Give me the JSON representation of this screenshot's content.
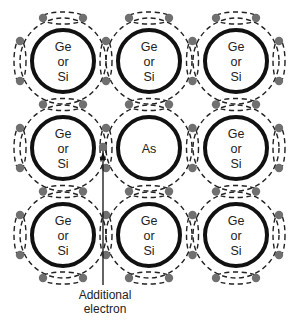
{
  "diagram": {
    "grid": {
      "rows": 3,
      "cols": 3,
      "centers_x": [
        63,
        149,
        236
      ],
      "centers_y": [
        61,
        148,
        235
      ],
      "atom_radius": 31,
      "bond_radius": 43
    },
    "atoms": [
      {
        "row": 0,
        "col": 0,
        "lines": [
          "Ge",
          "or",
          "Si"
        ]
      },
      {
        "row": 0,
        "col": 1,
        "lines": [
          "Ge",
          "or",
          "Si"
        ]
      },
      {
        "row": 0,
        "col": 2,
        "lines": [
          "Ge",
          "or",
          "Si"
        ]
      },
      {
        "row": 1,
        "col": 0,
        "lines": [
          "Ge",
          "or",
          "Si"
        ]
      },
      {
        "row": 1,
        "col": 1,
        "lines": [
          "As"
        ]
      },
      {
        "row": 1,
        "col": 2,
        "lines": [
          "Ge",
          "or",
          "Si"
        ]
      },
      {
        "row": 2,
        "col": 0,
        "lines": [
          "Ge",
          "or",
          "Si"
        ]
      },
      {
        "row": 2,
        "col": 1,
        "lines": [
          "Ge",
          "or",
          "Si"
        ]
      },
      {
        "row": 2,
        "col": 2,
        "lines": [
          "Ge",
          "or",
          "Si"
        ]
      }
    ],
    "extra_electron": {
      "x": 103,
      "y": 147
    },
    "annotation": {
      "line1": "Additional",
      "line2": "electron"
    },
    "colors": {
      "atom_stroke": "#111111",
      "bond_dash": "#222222",
      "electron": "#707070",
      "background": "#ffffff"
    }
  }
}
